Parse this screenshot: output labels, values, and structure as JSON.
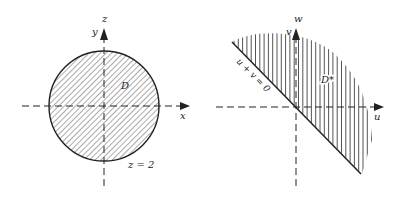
{
  "left_panel": {
    "region_label": "D",
    "axis_vertical_top_label": "z",
    "axis_vertical_label": "y",
    "axis_horizontal_label": "x",
    "boundary_label": "z = 2",
    "fill_pattern": "diagonal-hatch"
  },
  "right_panel": {
    "region_label": "D*",
    "axis_vertical_top_label": "w",
    "axis_vertical_label": "v",
    "axis_horizontal_label": "u",
    "line_label": "u + v = 0",
    "fill_pattern": "vertical-hatch"
  },
  "colors": {
    "ink": "#222222",
    "hatch": "#555555",
    "background": "#ffffff"
  }
}
